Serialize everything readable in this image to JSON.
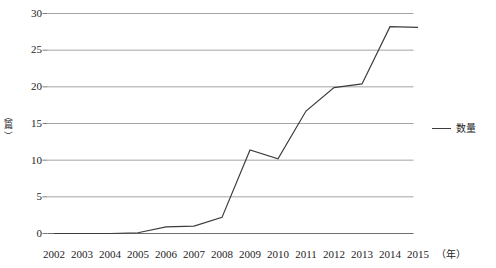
{
  "chart_data": {
    "type": "line",
    "title": "",
    "xlabel": "（年）",
    "ylabel": "（篇）",
    "categories": [
      "2002",
      "2003",
      "2004",
      "2005",
      "2006",
      "2007",
      "2008",
      "2009",
      "2010",
      "2011",
      "2012",
      "2013",
      "2014",
      "2015"
    ],
    "series": [
      {
        "name": "数量",
        "values": [
          0,
          0,
          0,
          0.1,
          0.9,
          1.0,
          2.2,
          11.4,
          10.2,
          16.7,
          19.9,
          20.4,
          28.2,
          28.1
        ]
      }
    ],
    "ylim": [
      0,
      30
    ],
    "yticks": [
      0,
      5,
      10,
      15,
      20,
      25,
      30
    ],
    "ytick_labels": [
      "0",
      "5",
      "10",
      "15",
      "20",
      "25",
      "30"
    ],
    "grid": true,
    "grid_axis": "y",
    "legend_position": "right",
    "line_color": "#3c3c3c",
    "grid_color": "#9a9a9a",
    "axis_color": "#6e6e6e"
  },
  "axis": {
    "y_unit_open": "（",
    "y_unit_char": "篇",
    "y_unit_close": "）"
  },
  "legend": {
    "entries": [
      {
        "label": "数量"
      }
    ]
  }
}
